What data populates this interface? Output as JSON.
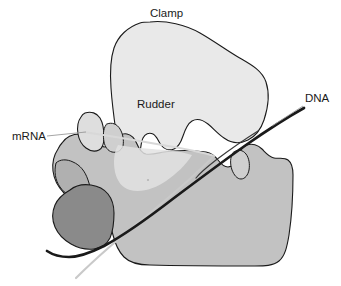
{
  "figure": {
    "type": "schematic-diagram",
    "background_color": "#ffffff"
  },
  "labels": {
    "clamp": "Clamp",
    "rudder": "Rudder",
    "mrna": "mRNA",
    "dna": "DNA"
  },
  "label_positions": {
    "clamp": {
      "x": 150,
      "y": 17
    },
    "rudder": {
      "x": 137,
      "y": 108
    },
    "mrna": {
      "x": 12,
      "y": 140
    },
    "dna": {
      "x": 305,
      "y": 102
    }
  },
  "colors": {
    "clamp_fill": "#e9e9e9",
    "body_fill": "#c2c2c2",
    "body_light_fill": "#cfcfcf",
    "lobe_fill": "#dedede",
    "dark_blob_fill": "#8a8a8a",
    "mid_blob_fill": "#b0b0b0",
    "outline": "#1a1a1a",
    "dna_strand": "#1a1a1a",
    "mrna_strand": "#d8d8d8",
    "mrna_leader": "#b9b9b9",
    "text": "#1a1a1a"
  },
  "strands": {
    "dna": {
      "name": "DNA",
      "color": "#1a1a1a",
      "stroke_width": 2.6,
      "description": "thick dark duplex entering from upper right, passing through the cleft, exiting lower left"
    },
    "mrna": {
      "name": "mRNA",
      "color": "#d8d8d8",
      "stroke_width": 2.2,
      "description": "pale transcript running from the left label across the cleft and down to the lower left corner"
    }
  },
  "leader_lines": {
    "mrna_leader": {
      "from_x": 46,
      "from_y": 136,
      "to_x": 86,
      "to_y": 132
    },
    "dna_leader": {
      "from_x": 303,
      "from_y": 106,
      "to_x": 268,
      "to_y": 134
    }
  }
}
